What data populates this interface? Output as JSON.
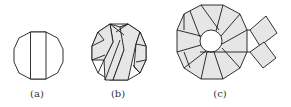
{
  "figure": {
    "panels": [
      {
        "id": "a",
        "label": "(a)",
        "description": "Decagon with single vertical strip"
      },
      {
        "id": "b",
        "label": "(b)",
        "description": "Decagon with woven diagonal strips"
      },
      {
        "id": "c",
        "label": "(c)",
        "description": "Decagonal ring with central hole and two protruding strips"
      }
    ]
  },
  "colors": {
    "stroke": "#1a1a1a",
    "fill": "#e6e6e6",
    "background": "#ffffff",
    "label": "#333333"
  }
}
